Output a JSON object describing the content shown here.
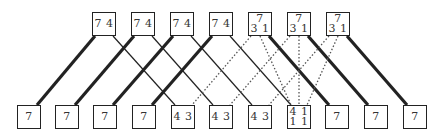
{
  "diagram": {
    "top_nodes": [
      {
        "x": 92,
        "y": 12,
        "rows": [
          "7 4"
        ]
      },
      {
        "x": 131,
        "y": 12,
        "rows": [
          "7 4"
        ]
      },
      {
        "x": 170,
        "y": 12,
        "rows": [
          "7 4"
        ]
      },
      {
        "x": 209,
        "y": 12,
        "rows": [
          "7 4"
        ]
      },
      {
        "x": 248,
        "y": 12,
        "rows": [
          "7",
          "3 1"
        ]
      },
      {
        "x": 287,
        "y": 12,
        "rows": [
          "7",
          "3 1"
        ]
      },
      {
        "x": 326,
        "y": 12,
        "rows": [
          "7",
          "3 1"
        ]
      }
    ],
    "bottom_nodes": [
      {
        "x": 17,
        "y": 105,
        "rows": [
          "7"
        ]
      },
      {
        "x": 55,
        "y": 105,
        "rows": [
          "7"
        ]
      },
      {
        "x": 93,
        "y": 105,
        "rows": [
          "7"
        ]
      },
      {
        "x": 132,
        "y": 105,
        "rows": [
          "7"
        ]
      },
      {
        "x": 171,
        "y": 105,
        "rows": [
          "4 3"
        ]
      },
      {
        "x": 209,
        "y": 105,
        "rows": [
          "4 3"
        ]
      },
      {
        "x": 248,
        "y": 105,
        "rows": [
          "4 3"
        ]
      },
      {
        "x": 287,
        "y": 105,
        "rows": [
          "4 1",
          "1 1"
        ]
      },
      {
        "x": 325,
        "y": 105,
        "rows": [
          "7"
        ]
      },
      {
        "x": 364,
        "y": 105,
        "rows": [
          "7"
        ]
      },
      {
        "x": 403,
        "y": 105,
        "rows": [
          "7"
        ]
      }
    ],
    "edges": [
      {
        "from": 0,
        "from_anchor": "left",
        "to": 0,
        "style": "thick"
      },
      {
        "from": 1,
        "from_anchor": "left",
        "to": 1,
        "style": "thick"
      },
      {
        "from": 2,
        "from_anchor": "left",
        "to": 2,
        "style": "thick"
      },
      {
        "from": 3,
        "from_anchor": "left",
        "to": 3,
        "style": "thick"
      },
      {
        "from": 0,
        "from_anchor": "right",
        "to": 4,
        "style": "thin"
      },
      {
        "from": 1,
        "from_anchor": "right",
        "to": 5,
        "style": "thin"
      },
      {
        "from": 2,
        "from_anchor": "right",
        "to": 6,
        "style": "thin"
      },
      {
        "from": 3,
        "from_anchor": "right",
        "to": 7,
        "style": "thin"
      },
      {
        "from": 4,
        "from_anchor": "right",
        "to": 8,
        "style": "thick"
      },
      {
        "from": 5,
        "from_anchor": "right",
        "to": 9,
        "style": "thick"
      },
      {
        "from": 6,
        "from_anchor": "right",
        "to": 10,
        "style": "thick"
      },
      {
        "from": 4,
        "from_anchor": "left",
        "to": 4,
        "style": "dotted"
      },
      {
        "from": 5,
        "from_anchor": "left",
        "to": 5,
        "style": "dotted"
      },
      {
        "from": 6,
        "from_anchor": "left",
        "to": 6,
        "style": "dotted"
      },
      {
        "from": 4,
        "from_anchor": "mid",
        "to": 7,
        "style": "dotted"
      },
      {
        "from": 5,
        "from_anchor": "mid",
        "to": 7,
        "style": "dotted"
      },
      {
        "from": 6,
        "from_anchor": "mid",
        "to": 7,
        "style": "dotted"
      }
    ],
    "colors": {
      "line": "#222222",
      "dotted": "#555555",
      "text": "#333333"
    }
  }
}
